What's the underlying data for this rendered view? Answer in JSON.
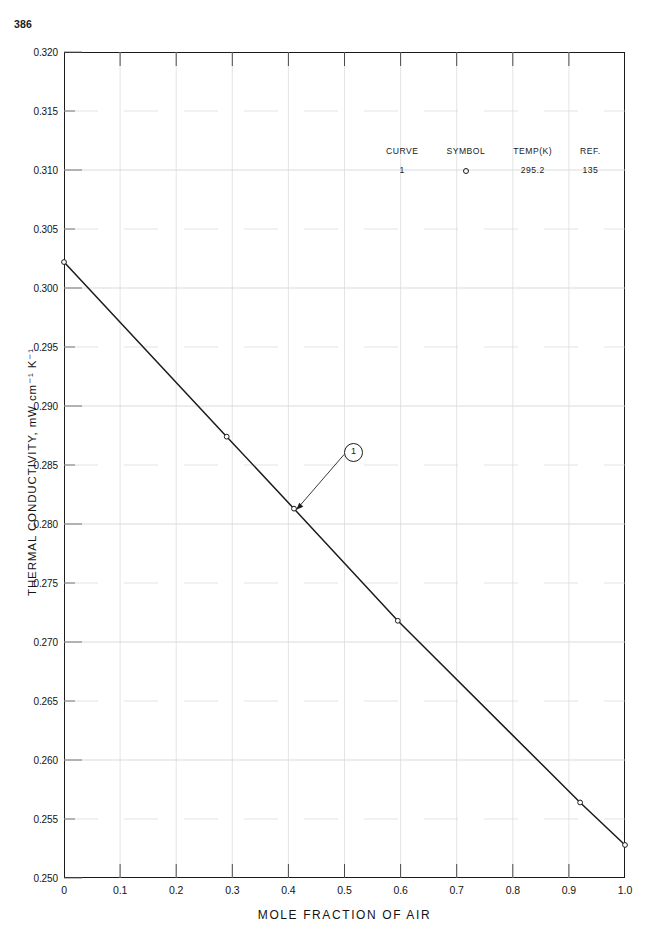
{
  "page": {
    "number": "386"
  },
  "chart_data": {
    "type": "line",
    "title": "",
    "xlabel": "MOLE FRACTION OF AIR",
    "ylabel": "THERMAL CONDUCTIVITY, mW cm⁻¹ K⁻¹",
    "xlim": [
      0,
      1.0
    ],
    "ylim": [
      0.25,
      0.32
    ],
    "grid": true,
    "xticks": [
      0,
      0.1,
      0.2,
      0.3,
      0.4,
      0.5,
      0.6,
      0.7,
      0.8,
      0.9,
      1.0
    ],
    "xtick_labels": [
      "0",
      "0.1",
      "0.2",
      "0.3",
      "0.4",
      "0.5",
      "0.6",
      "0.7",
      "0.8",
      "0.9",
      "1.0"
    ],
    "yticks": [
      0.25,
      0.255,
      0.26,
      0.265,
      0.27,
      0.275,
      0.28,
      0.285,
      0.29,
      0.295,
      0.3,
      0.305,
      0.31,
      0.315,
      0.32
    ],
    "ytick_labels": [
      "0.250",
      "0.255",
      "0.260",
      "0.265",
      "0.270",
      "0.275",
      "0.280",
      "0.285",
      "0.290",
      "0.295",
      "0.300",
      "0.305",
      "0.310",
      "0.315",
      "0.320"
    ],
    "series": [
      {
        "name": "1",
        "symbol": "circle-open",
        "x": [
          0.0,
          0.29,
          0.41,
          0.595,
          0.92,
          1.0
        ],
        "y": [
          0.3022,
          0.2874,
          0.2813,
          0.2718,
          0.2564,
          0.2528
        ],
        "markers_x": [
          0.0,
          0.29,
          0.41,
          0.595,
          0.92,
          1.0
        ],
        "markers_y": [
          0.3022,
          0.2874,
          0.2813,
          0.2718,
          0.2564,
          0.2528
        ]
      }
    ],
    "annotations": [
      {
        "label": "1",
        "style": "circled",
        "label_x": 0.51,
        "label_y": 0.2864,
        "point_x": 0.414,
        "point_y": 0.2812
      }
    ],
    "legend": {
      "position": "upper-right-inside",
      "headers": [
        "CURVE",
        "SYMBOL",
        "TEMP(K)",
        "REF."
      ],
      "rows": [
        {
          "curve": "1",
          "symbol": "circle-open",
          "temp": "295.2",
          "ref": "135"
        }
      ]
    }
  }
}
